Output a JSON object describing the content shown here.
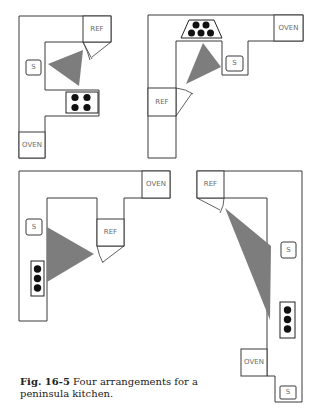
{
  "figure": {
    "caption": {
      "number": "Fig. 16-5",
      "text": " Four arrangements for a peninsula kitchen."
    },
    "colors": {
      "outline": "#3a3a3a",
      "triangle": "#7d7d7d",
      "burner": "#111111",
      "label": "#6a6a6a"
    },
    "arrangements": [
      {
        "id": 1,
        "position": "top-left",
        "labels": {
          "refrigerator": "REF",
          "sink": "S",
          "oven": "OVEN"
        },
        "burners": 4
      },
      {
        "id": 2,
        "position": "top-right",
        "labels": {
          "refrigerator": "REF",
          "sink": "S",
          "oven": "OVEN"
        },
        "burners": 5
      },
      {
        "id": 3,
        "position": "bottom-left",
        "labels": {
          "refrigerator": "REF",
          "sink": "S",
          "oven": "OVEN"
        },
        "burners": 3
      },
      {
        "id": 4,
        "position": "bottom-right",
        "labels": {
          "refrigerator": "REF",
          "sink_upper": "S",
          "sink_lower": "S",
          "oven": "OVEN"
        },
        "burners": 3
      }
    ]
  }
}
